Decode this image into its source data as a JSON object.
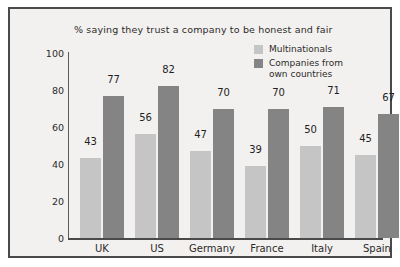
{
  "chart_data": {
    "type": "bar",
    "title": "% saying they trust a company to be honest and fair",
    "xlabel": "",
    "ylabel": "",
    "ylim": [
      0,
      100
    ],
    "yticks": [
      0,
      20,
      40,
      60,
      80,
      100
    ],
    "grid": false,
    "legend_position": "top-right",
    "categories": [
      "UK",
      "US",
      "Germany",
      "France",
      "Italy",
      "Spain"
    ],
    "series": [
      {
        "name": "Multinationals",
        "color": "#c5c5c5",
        "values": [
          43,
          56,
          47,
          39,
          50,
          45
        ]
      },
      {
        "name": "Companies from\nown countries",
        "color": "#848484",
        "values": [
          77,
          82,
          70,
          70,
          71,
          67
        ]
      }
    ]
  },
  "colors": {
    "frame": "#4a4a4a",
    "background": "#f3f1ef",
    "axis": "#5a5a5a",
    "text": "#2b2b2b",
    "series_light": "#c5c5c5",
    "series_dark": "#848484"
  }
}
